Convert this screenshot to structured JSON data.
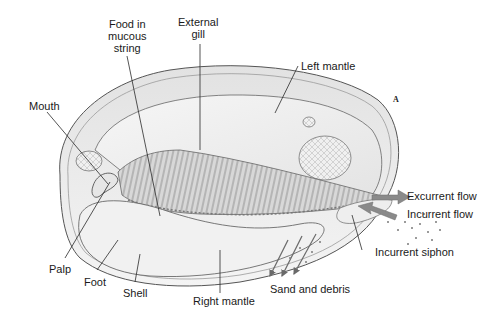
{
  "diagram": {
    "panel_letter": "A",
    "labels": {
      "food_in_mucous_string": [
        "Food in",
        "mucous",
        "string"
      ],
      "external_gill": [
        "External",
        "gill"
      ],
      "left_mantle": "Left mantle",
      "mouth": "Mouth",
      "excurrent_flow": "Excurrent flow",
      "incurrent_flow": "Incurrent flow",
      "incurrent_siphon": "Incurrent siphon",
      "palp": "Palp",
      "foot": "Foot",
      "shell": "Shell",
      "right_mantle": "Right mantle",
      "sand_and_debris": "Sand and debris"
    },
    "colors": {
      "line": "#2a2a2a",
      "shell_fill": "#ececec",
      "mantle_fill": "#f3f3f3",
      "gill_fill": "#cfcfcf",
      "flow_arrow": "#8a8a8a",
      "text": "#1a1a1a"
    }
  }
}
